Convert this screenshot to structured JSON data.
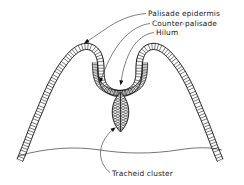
{
  "figure": {
    "kind": "botanical-cross-section",
    "background_color": "#ffffff",
    "ink_color": "#111111",
    "leader_color": "#2b2b2b"
  },
  "labels": [
    {
      "id": "palisade-epidermis",
      "text": "Palisade epidermis",
      "text_x": 148,
      "text_y": 16,
      "anchor": "start",
      "leader_path": "M 146 13.5 C 132 14.5, 118 20, 104 30 C 96 35.5, 90 39.5, 85.5 42.5",
      "arrow_x": 84.0,
      "arrow_y": 43.4,
      "arrow_angle": 146
    },
    {
      "id": "counter-palisade",
      "text": "Counter-palisade",
      "text_x": 152,
      "text_y": 26,
      "anchor": "start",
      "leader_path": "M 150 23.5 C 138 25, 126 33, 116 48 C 109 58.5, 103.5 72, 100.5 81",
      "arrow_x": 100.0,
      "arrow_y": 83.0,
      "arrow_angle": 104
    },
    {
      "id": "hilum",
      "text": "Hilum",
      "text_x": 156,
      "text_y": 35,
      "anchor": "start",
      "leader_path": "M 154 32.5 C 143 34, 134 42, 128 56 C 123.5 67, 121.5 77, 121 83",
      "arrow_x": 120.5,
      "arrow_y": 85.5,
      "arrow_angle": 100
    },
    {
      "id": "tracheid-cluster",
      "text": "Tracheid cluster",
      "text_x": 112,
      "text_y": 176,
      "anchor": "start",
      "leader_path": "M 110 172.5 C 104 168, 100 160, 100.5 152 C 101 143, 107 134, 114 128.5",
      "arrow_x": 115.8,
      "arrow_y": 127.2,
      "arrow_angle": -38
    }
  ],
  "structures": {
    "outer_palisade_band": {
      "name": "Palisade epidermis band",
      "description": "Double-walled ladder band forming two humps and a central cup",
      "center_path": "M 20 160 C 26 146, 32 128, 40 110 C 48 90, 56 72, 68 58 C 76 48, 86 43, 94 49 C 100 53.5, 101 62, 101 70 C 101 78, 102 84, 106 88 C 110 92, 115 93.5, 120 93.5 C 125 93.5, 130 92, 134 88 C 138 84, 139 78, 139 70 C 139 62, 140 53.5, 146 49 C 154 43, 164 48, 172 58 C 184 72, 192 90, 200 110 C 208 128, 214 146, 220 160",
      "band_half_width": 3.1,
      "rung_count": 132
    },
    "inner_counter_palisade": {
      "name": "Counter-palisade band",
      "description": "Shorter inner hatched arc lining the cup above the hilum",
      "center_path": "M 95 63 C 95 72, 96 80, 100 85 C 106 91, 113 93, 120 93 C 127 93, 134 91, 140 85 C 144 80, 145 72, 145 63",
      "band_half_width": 2.6,
      "rung_count": 58
    },
    "hilum_notch": {
      "name": "Hilum",
      "description": "Central V-shaped groove where the two palisade arcs meet",
      "x": 120.5,
      "y": 93
    },
    "tracheid_cluster": {
      "name": "Tracheid cluster",
      "description": "Pointed lens/oval body with diagonal hatching hanging below the hilum",
      "cx": 120.5,
      "cy": 112,
      "rx": 11,
      "ry": 20,
      "hatch_count": 15
    },
    "ground_line": {
      "name": "Underlying tissue line",
      "path": "M 18 156 C 46 148, 74 146, 100 150 C 126 154, 152 154, 178 150 C 196 147, 210 147, 222 150"
    }
  }
}
